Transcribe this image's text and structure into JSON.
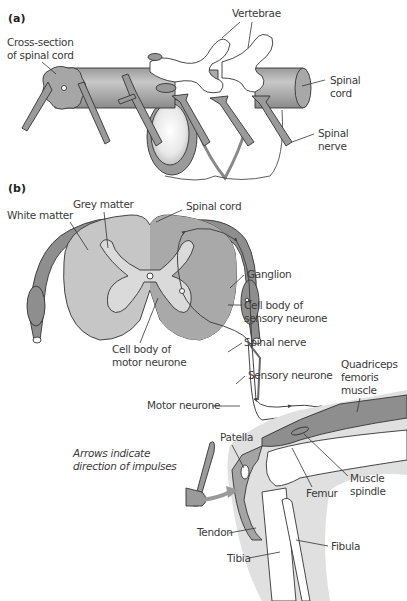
{
  "panels": {
    "a": {
      "tag": "(a)",
      "labels": {
        "vertebrae": "Vertebrae",
        "cross_section_1": "Cross-section",
        "cross_section_2": "of spinal cord",
        "spinal_cord_1": "Spinal",
        "spinal_cord_2": "cord",
        "spinal_nerve_1": "Spinal",
        "spinal_nerve_2": "nerve"
      }
    },
    "b": {
      "tag": "(b)",
      "labels": {
        "grey_matter": "Grey matter",
        "white_matter": "White matter",
        "spinal_cord": "Spinal cord",
        "ganglion": "Ganglion",
        "sensory_cell_body_1": "Cell body of",
        "sensory_cell_body_2": "sensory neurone",
        "motor_cell_body_1": "Cell body of",
        "motor_cell_body_2": "motor neurone",
        "spinal_nerve": "Spinal nerve",
        "sensory_neurone": "Sensory neurone",
        "quadriceps_1": "Quadriceps",
        "quadriceps_2": "femoris",
        "quadriceps_3": "muscle",
        "motor_neurone": "Motor neurone",
        "patella": "Patella",
        "muscle_spindle_1": "Muscle",
        "muscle_spindle_2": "spindle",
        "femur": "Femur",
        "tendon": "Tendon",
        "fibula": "Fibula",
        "tibia": "Tibia"
      },
      "note_1": "Arrows indicate",
      "note_2": "direction of impulses"
    }
  },
  "colors": {
    "dark_grey": "#8e8e8e",
    "mid_grey": "#b4b4b4",
    "light_grey": "#d6d6d6",
    "skin_grey": "#e2e2e2",
    "outline": "#333333"
  }
}
